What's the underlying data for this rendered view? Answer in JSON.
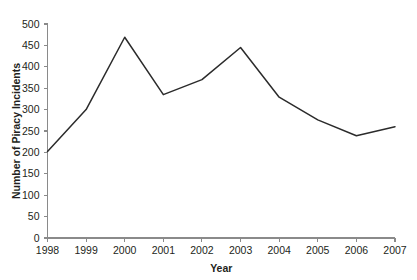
{
  "chart_data": {
    "type": "line",
    "title": "",
    "xlabel": "Year",
    "ylabel": "Number of Piracy Incidents",
    "categories": [
      "1998",
      "1999",
      "2000",
      "2001",
      "2002",
      "2003",
      "2004",
      "2005",
      "2006",
      "2007"
    ],
    "x": [
      1998,
      1999,
      2000,
      2001,
      2002,
      2003,
      2004,
      2005,
      2006,
      2007
    ],
    "values": [
      202,
      300,
      469,
      335,
      370,
      445,
      329,
      276,
      239,
      260
    ],
    "series": [
      {
        "name": "Piracy Incidents",
        "values": [
          202,
          300,
          469,
          335,
          370,
          445,
          329,
          276,
          239,
          260
        ]
      }
    ],
    "ylim": [
      0,
      500
    ],
    "ytick_labels": [
      "0",
      "50",
      "100",
      "150",
      "200",
      "250",
      "300",
      "350",
      "400",
      "450",
      "500"
    ],
    "yticks": [
      0,
      50,
      100,
      150,
      200,
      250,
      300,
      350,
      400,
      450,
      500
    ],
    "xtick_labels": [
      "1998",
      "1999",
      "2000",
      "2001",
      "2002",
      "2003",
      "2004",
      "2005",
      "2006",
      "2007"
    ],
    "grid": false,
    "legend": false,
    "legend_position": "none",
    "line_color": "#2b2b2b",
    "axis_color": "#8a8a8a",
    "background_color": "#ffffff"
  }
}
